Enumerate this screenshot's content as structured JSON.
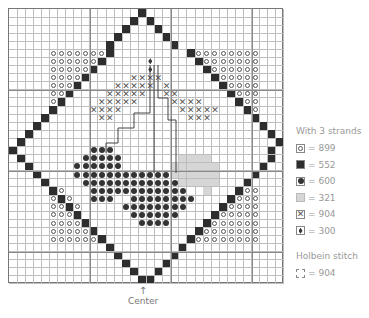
{
  "legend": {
    "title": "With 3 strands",
    "items": [
      {
        "symbol": "O",
        "icon": "open-circle-icon",
        "label": "= 899"
      },
      {
        "symbol": "B",
        "icon": "filled-square-icon",
        "label": "= 552"
      },
      {
        "symbol": "C",
        "icon": "filled-circle-icon",
        "label": "= 600"
      },
      {
        "symbol": "P",
        "icon": "light-shaded-square-icon",
        "label": "= 321"
      },
      {
        "symbol": "X",
        "icon": "cross-icon",
        "label": "= 904"
      },
      {
        "symbol": "D",
        "icon": "diamond-icon",
        "label": "= 300"
      }
    ],
    "holbein_title": "Holbein stitch",
    "holbein_item": {
      "icon": "holbein-line-icon",
      "label": "= 904"
    }
  },
  "center_label": "Center",
  "center_arrow": "↑",
  "grid": {
    "cols": 34,
    "rows": 34,
    "pattern": [
      "................B.................",
      "...............B.B................",
      "..............B...B...............",
      ".............B.....B..............",
      "............B.......B.............",
      ".....OOOOOOOB.........BOOOOOOOO...",
      ".....OOOOOOB.....D.....BOOOOOOO...",
      ".....OOOOOB......D......BOOOOOO...",
      ".....OOOOB.....XXXX......BOOOOO...",
      ".....OOOB....XXXXX.X......BOOOO...",
      ".....OOB....XXXXX..XX......BOOO...",
      ".....OB....XXXXX....XXXX....BOO...",
      ".....B....XXXX.......XXXXX...BO...",
      "....B......XX.........XXX.....B...",
      "...B...........................B..",
      "..B.............................B.",
      ".B...............................B",
      "B.........CCC...................B.",
      ".B.......CCCCC.......PPPP.......B..",
      "..B.....CCCCCC......PPPPPP.....B...",
      "...B....CCCCCCCCCCCCPPPPPP....B....",
      "....B....CCCCCCCCCCCCPPPPP...B.....",
      ".....BO...CCCCCCCCCCCC..P...BOO....",
      ".....OBO..CCC..CCCCCCCC....BOOO....",
      ".....OOBO.....CCCCCCCC....BOOOO....",
      ".....OOOB......CCCCCC....BOOOOO....",
      ".....OOOOB......CCCC....BOOOOOO....",
      ".....OOOOOB............BOOOOOOO....",
      ".....OOOOOOB..........BOOOOOOOO....",
      "............B........B............",
      ".............B......B.............",
      "..............B....B..............",
      "...............B..B...............",
      "................BB................"
    ]
  }
}
